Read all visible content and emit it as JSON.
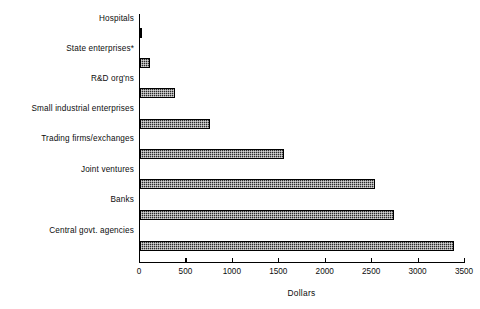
{
  "chart_data": {
    "type": "bar",
    "orientation": "horizontal",
    "title": "",
    "xlabel": "Dollars",
    "ylabel": "",
    "xlim": [
      0,
      3500
    ],
    "xticks": [
      0,
      500,
      1000,
      1500,
      2000,
      2500,
      3000,
      3500
    ],
    "xtick_labels": [
      "0",
      "500",
      "1000",
      "1500",
      "2000",
      "2500",
      "3000",
      "3500"
    ],
    "grid": false,
    "legend": null,
    "bar_fill": "#2b2b2b",
    "bar_edge": "#000000",
    "categories": [
      "Hospitals",
      "State enterprises*",
      "R&D org'ns",
      "Small industrial enterprises",
      "Trading firms/exchanges",
      "Joint ventures",
      "Banks",
      "Central govt. agencies"
    ],
    "values": [
      25,
      105,
      375,
      755,
      1555,
      2530,
      2740,
      3380
    ],
    "footnote": "*"
  }
}
